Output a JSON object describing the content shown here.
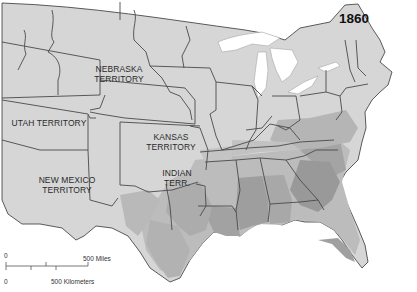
{
  "map": {
    "year": "1860",
    "territory_labels": [
      {
        "line1": "NEBRASKA",
        "line2": "TERRITORY"
      },
      {
        "line1": "UTAH TERRITORY",
        "line2": ""
      },
      {
        "line1": "KANSAS",
        "line2": "TERRITORY"
      },
      {
        "line1": "NEW MEXICO",
        "line2": "TERRITORY"
      },
      {
        "line1": "INDIAN",
        "line2": "TERR."
      }
    ],
    "scale_bar": {
      "miles_zero": "0",
      "miles_label": "500 Miles",
      "km_zero": "0",
      "km_label": "500 Kilometers"
    },
    "colors": {
      "land": "#d6d6d6",
      "border": "#4a4a4a",
      "shade_light": "#bdbdbd",
      "shade_mid": "#a3a3a3",
      "shade_dark": "#8a8a8a",
      "water": "#ffffff"
    }
  }
}
